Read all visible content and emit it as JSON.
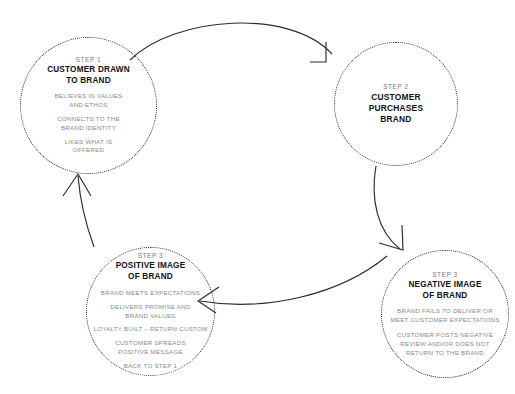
{
  "diagram": {
    "colors": {
      "stroke": "#2b2b2b",
      "step_label": "#7d7d7d",
      "node_title": "#111111",
      "body_text": "#8a8a8a",
      "background": "#ffffff"
    },
    "nodes": [
      {
        "id": "step1",
        "step_label": "STEP 1",
        "title": "CUSTOMER DRAWN\nTO BRAND",
        "bullets": [
          "BELIEVES IN VALUES\nAND ETHOS",
          "CONNECTS TO THE\nBRAND IDENTITY",
          "LIKES WHAT IS\nOFFERED"
        ]
      },
      {
        "id": "step2",
        "step_label": "STEP 2",
        "title": "CUSTOMER\nPURCHASES\nBRAND",
        "bullets": []
      },
      {
        "id": "step3-positive",
        "step_label": "STEP 3",
        "title": "POSITIVE IMAGE\nOF BRAND",
        "bullets": [
          "BRAND MEETS EXPECTATIONS",
          "DELIVERS PROMISE AND\nBRAND VALUES",
          "LOYALTY BUILT – RETURN CUSTOM",
          "CUSTOMER SPREADS\nPOSITIVE MESSAGE",
          "BACK TO STEP 1"
        ]
      },
      {
        "id": "step3-negative",
        "step_label": "STEP 3",
        "title": "NEGATIVE IMAGE\nOF BRAND",
        "bullets": [
          "BRAND FAILS TO DELIVER OR\nMEET CUSTOMER EXPECTATIONS",
          "CUSTOMER POSTS NEGATIVE\nREVIEW AND/OR DOES NOT\nRETURN TO THE BRAND"
        ]
      }
    ],
    "connectors": [
      {
        "id": "step1-to-step2",
        "from": "step1",
        "to": "step2"
      },
      {
        "id": "step2-to-step3-negative",
        "from": "step2",
        "to": "step3-negative"
      },
      {
        "id": "step3-negative-to-step3-positive",
        "from": "step3-negative",
        "to": "step3-positive"
      },
      {
        "id": "step3-positive-to-step1",
        "from": "step3-positive",
        "to": "step1"
      }
    ]
  }
}
